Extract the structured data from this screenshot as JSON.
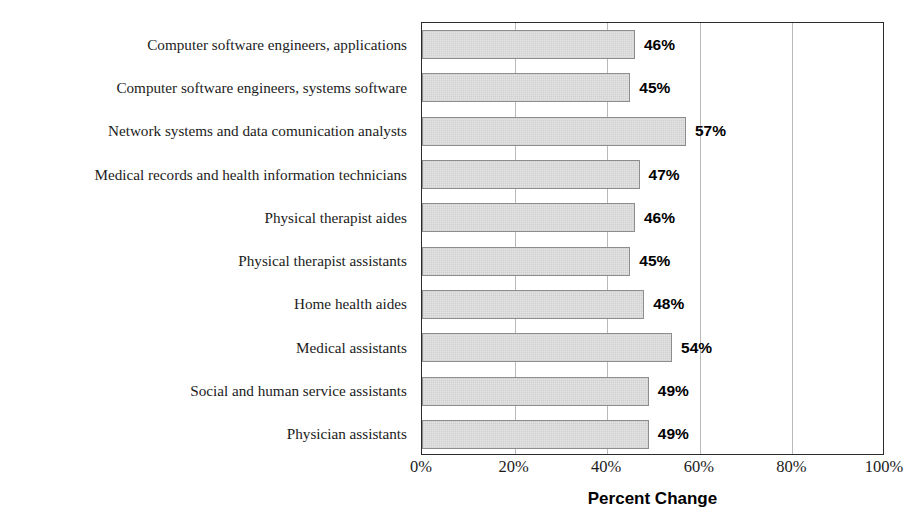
{
  "chart_data": {
    "type": "bar",
    "orientation": "horizontal",
    "title": "",
    "title_note": "chart title is cropped off the top edge of the screenshot and is not legible",
    "xlabel": "Percent Change",
    "ylabel": "",
    "xlim": [
      0,
      100
    ],
    "xtick_labels": [
      "0%",
      "20%",
      "40%",
      "60%",
      "80%",
      "100%"
    ],
    "xtick_values": [
      0,
      20,
      40,
      60,
      80,
      100
    ],
    "grid": "vertical gridlines at 20, 40, 60, 80",
    "legend": "none",
    "bar_fill_color": "#e4e4e4",
    "bar_border_color": "#8d8d8d",
    "axis_color": "#2b2b2b",
    "gridline_color": "#b9b9b9",
    "categories": [
      "Computer software engineers, applications",
      "Computer software engineers, systems software",
      "Network systems and data comunication analysts",
      "Medical records and health information technicians",
      "Physical therapist aides",
      "Physical therapist assistants",
      "Home health aides",
      "Medical assistants",
      "Social and human service assistants",
      "Physician assistants"
    ],
    "values": [
      46,
      45,
      57,
      47,
      46,
      45,
      48,
      54,
      49,
      49
    ],
    "data_labels": [
      "46%",
      "45%",
      "57%",
      "47%",
      "46%",
      "45%",
      "48%",
      "54%",
      "49%",
      "49%"
    ]
  }
}
